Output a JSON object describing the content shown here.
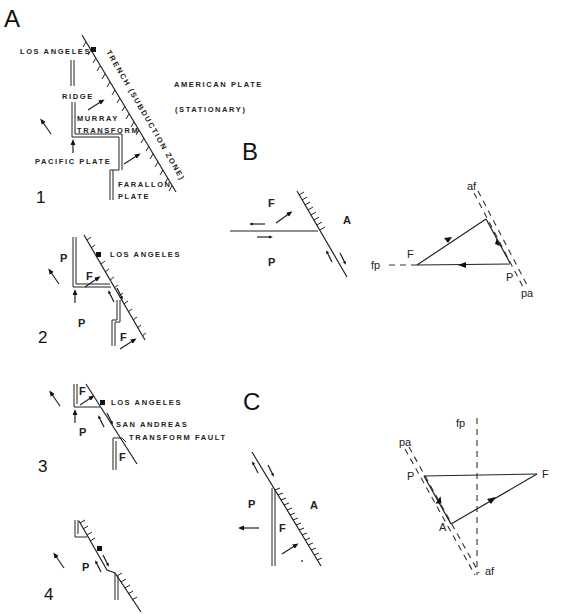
{
  "figure": {
    "panels": {
      "A": {
        "letter": "A",
        "steps": [
          {
            "number": "1",
            "labels": {
              "los_angeles": "LOS ANGELES",
              "trench": "TRENCH (SUBDUCTION ZONE)",
              "american_plate": "AMERICAN PLATE",
              "stationary": "(STATIONARY)",
              "ridge": "RIDGE",
              "murray": "MURRAY",
              "transform": "TRANSFORM",
              "pacific_plate": "PACIFIC PLATE",
              "farallon": "FARALLON",
              "plate": "PLATE"
            }
          },
          {
            "number": "2",
            "labels": {
              "los_angeles": "LOS ANGELES",
              "p_upper": "P",
              "p_lower": "P",
              "f_upper": "F",
              "f_lower": "F"
            }
          },
          {
            "number": "3",
            "labels": {
              "los_angeles": "LOS ANGELES",
              "san_andreas": "SAN ANDREAS",
              "transform_fault": "TRANSFORM FAULT",
              "f_upper": "F",
              "f_lower": "F",
              "p": "P"
            }
          },
          {
            "number": "4",
            "labels": {
              "p": "P"
            }
          }
        ]
      },
      "B": {
        "letter": "B",
        "map_labels": {
          "f": "F",
          "p": "P",
          "a": "A"
        },
        "vector_labels": {
          "af": "af",
          "fp": "fp",
          "pa": "pa",
          "f": "F",
          "p": "P"
        }
      },
      "C": {
        "letter": "C",
        "map_labels": {
          "p": "P",
          "f": "F",
          "a": "A"
        },
        "vector_labels": {
          "fp": "fp",
          "pa": "pa",
          "p": "P",
          "a": "A",
          "f": "F",
          "af": "af"
        }
      }
    }
  }
}
